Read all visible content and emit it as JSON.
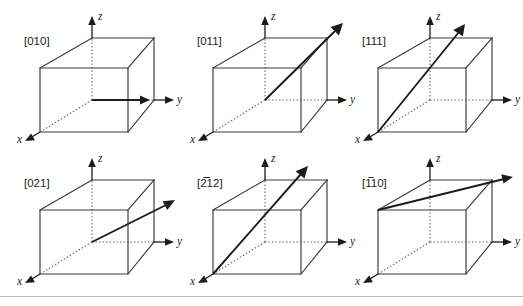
{
  "figure": {
    "background_color": "#ffffff",
    "edge_color": "#3a3a3a",
    "hidden_edge_color": "#6a6a6a",
    "axis_color": "#1c1c1c",
    "arrow_color": "#1c1c1c",
    "rule_color": "#b9b9b9",
    "columns": 3,
    "rows": 2
  },
  "axes": {
    "x_label": "x",
    "y_label": "y",
    "z_label": "z"
  },
  "cells": [
    {
      "id": "cell-010",
      "index_label": "[010]",
      "overbar_chars": [],
      "direction": [
        0,
        1,
        0
      ],
      "description": "arrow along y axis on front-bottom edge",
      "arrow": {
        "from": "origin",
        "to": "y-edge-right",
        "style": "in-plane-horizontal"
      }
    },
    {
      "id": "cell-011",
      "index_label": "[011]",
      "overbar_chars": [],
      "direction": [
        0,
        1,
        1
      ],
      "description": "arrow from origin to top back right corner",
      "arrow": {
        "from": "origin",
        "to": "top-right-corner",
        "style": "diagonal-up-right"
      }
    },
    {
      "id": "cell-111",
      "index_label": "[111]",
      "overbar_chars": [],
      "direction": [
        1,
        1,
        1
      ],
      "description": "arrow from front bottom origin through body diagonal",
      "arrow": {
        "from": "origin",
        "to": "body-diagonal",
        "style": "steep-up-right"
      }
    },
    {
      "id": "cell-021",
      "index_label": "[021]",
      "overbar_chars": [],
      "direction": [
        0,
        2,
        1
      ],
      "description": "shallow arrow rising toward upper right",
      "arrow": {
        "from": "origin",
        "to": "mid-right-upper",
        "style": "shallow-up-right"
      }
    },
    {
      "id": "cell-2bar12",
      "index_label": "[212]",
      "overbar_chars": [
        0
      ],
      "direction": [
        -2,
        1,
        2
      ],
      "description": "arrow from front x corner steeply up to the right",
      "arrow": {
        "from": "x-axis-corner",
        "to": "upper-right",
        "style": "long-diagonal"
      }
    },
    {
      "id": "cell-1bar10",
      "index_label": "[110]",
      "overbar_chars": [
        0
      ],
      "direction": [
        -1,
        1,
        0
      ],
      "description": "arrow along top face from front left to back right",
      "arrow": {
        "from": "top-front-left",
        "to": "top-back-right",
        "style": "top-face-diagonal"
      }
    }
  ]
}
